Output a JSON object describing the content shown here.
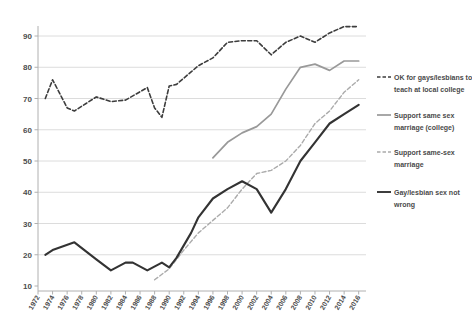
{
  "chart_data": {
    "type": "line",
    "title": "",
    "xlabel": "",
    "ylabel": "",
    "grid": "horizontal",
    "legend_position": "right",
    "x_range": [
      1972,
      2017
    ],
    "y_range": [
      10,
      95
    ],
    "x_ticks": [
      1972,
      1974,
      1976,
      1978,
      1980,
      1982,
      1984,
      1986,
      1988,
      1990,
      1992,
      1994,
      1996,
      1998,
      2000,
      2002,
      2004,
      2006,
      2008,
      2010,
      2012,
      2014,
      2016
    ],
    "y_ticks": [
      10,
      20,
      30,
      40,
      50,
      60,
      70,
      80,
      90
    ],
    "colors": {
      "grid": "#dcdcdc",
      "axis": "#b0b0b0",
      "tick_label": "#4d4d4d",
      "legend_text": "#4a4a4a"
    },
    "series": [
      {
        "name": "OK for gays/lesbians to teach at local college",
        "legend_lines": [
          "OK for gays/lesbians to",
          "teach at local college"
        ],
        "color": "#3d3d3d",
        "style": "dashed",
        "width": 1.6,
        "points": [
          [
            1973,
            70
          ],
          [
            1974,
            76
          ],
          [
            1976,
            67
          ],
          [
            1977,
            66
          ],
          [
            1980,
            70.5
          ],
          [
            1982,
            69
          ],
          [
            1984,
            69.5
          ],
          [
            1987,
            73.5
          ],
          [
            1988,
            67
          ],
          [
            1989,
            64
          ],
          [
            1990,
            74
          ],
          [
            1991,
            74.5
          ],
          [
            1993,
            78.5
          ],
          [
            1994,
            80.5
          ],
          [
            1996,
            83
          ],
          [
            1998,
            88
          ],
          [
            2000,
            88.5
          ],
          [
            2002,
            88.5
          ],
          [
            2004,
            84
          ],
          [
            2006,
            88
          ],
          [
            2008,
            90
          ],
          [
            2010,
            88
          ],
          [
            2012,
            91
          ],
          [
            2014,
            93
          ],
          [
            2016,
            93
          ]
        ]
      },
      {
        "name": "Support same sex marriage (college)",
        "legend_lines": [
          "Support same sex",
          "marriage (college)"
        ],
        "color": "#999999",
        "style": "solid",
        "width": 1.7,
        "points": [
          [
            1996,
            51
          ],
          [
            1998,
            56
          ],
          [
            2000,
            59
          ],
          [
            2002,
            61
          ],
          [
            2004,
            65
          ],
          [
            2006,
            73
          ],
          [
            2008,
            80
          ],
          [
            2010,
            81
          ],
          [
            2012,
            79
          ],
          [
            2014,
            82
          ],
          [
            2016,
            82
          ]
        ]
      },
      {
        "name": "Support same-sex marriage",
        "legend_lines": [
          "Support same-sex",
          "marriage"
        ],
        "color": "#ababab",
        "style": "dashed",
        "width": 1.4,
        "points": [
          [
            1988,
            12
          ],
          [
            1990,
            15.5
          ],
          [
            1992,
            21.5
          ],
          [
            1994,
            27
          ],
          [
            1996,
            31
          ],
          [
            1998,
            35
          ],
          [
            2000,
            41
          ],
          [
            2002,
            46
          ],
          [
            2004,
            47
          ],
          [
            2006,
            50
          ],
          [
            2008,
            55
          ],
          [
            2010,
            62
          ],
          [
            2012,
            66
          ],
          [
            2014,
            72
          ],
          [
            2016,
            76
          ]
        ]
      },
      {
        "name": "Gay/lesbian sex not wrong",
        "legend_lines": [
          "Gay/lesbian sex not",
          "wrong"
        ],
        "color": "#333333",
        "style": "solid",
        "width": 2.1,
        "points": [
          [
            1973,
            20
          ],
          [
            1974,
            21.5
          ],
          [
            1977,
            24
          ],
          [
            1980,
            18.5
          ],
          [
            1982,
            15
          ],
          [
            1984,
            17.5
          ],
          [
            1985,
            17.5
          ],
          [
            1987,
            15
          ],
          [
            1989,
            17.5
          ],
          [
            1990,
            16
          ],
          [
            1991,
            19
          ],
          [
            1993,
            27
          ],
          [
            1994,
            32
          ],
          [
            1996,
            38
          ],
          [
            1998,
            41
          ],
          [
            2000,
            43.5
          ],
          [
            2002,
            41
          ],
          [
            2004,
            33.5
          ],
          [
            2006,
            41
          ],
          [
            2008,
            50
          ],
          [
            2010,
            56
          ],
          [
            2012,
            62
          ],
          [
            2014,
            65
          ],
          [
            2016,
            68
          ]
        ]
      }
    ]
  }
}
